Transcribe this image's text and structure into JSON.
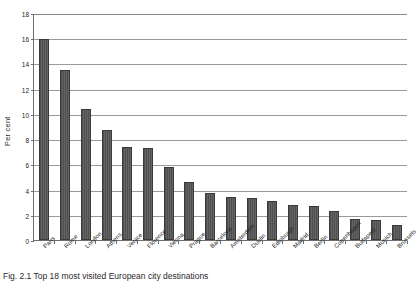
{
  "chart_data": {
    "type": "bar",
    "title": "",
    "xlabel": "",
    "ylabel": "Per cent",
    "ylim": [
      0,
      18
    ],
    "ytick_step": 2,
    "yticks": [
      0,
      2,
      4,
      6,
      8,
      10,
      12,
      14,
      16,
      18
    ],
    "grid": true,
    "legend": "none",
    "bar_color": "#555555",
    "categories": [
      "Paris",
      "Rome",
      "London",
      "Athens",
      "Venice",
      "Florence",
      "Vienna",
      "Prague",
      "Barcelona",
      "Amsterdam",
      "Dublin",
      "Edinburgh",
      "Madrid",
      "Berlin",
      "Copenhagen",
      "Budapest",
      "Munich",
      "Brussels"
    ],
    "values": [
      15.9,
      13.5,
      10.4,
      8.7,
      7.4,
      7.3,
      5.8,
      4.6,
      3.7,
      3.4,
      3.3,
      3.1,
      2.8,
      2.7,
      2.3,
      1.7,
      1.6,
      1.2
    ]
  },
  "caption": {
    "text": "Fig. 2.1   Top 18 most visited European city destinations"
  },
  "axis": {
    "y_title": "Per cent"
  }
}
